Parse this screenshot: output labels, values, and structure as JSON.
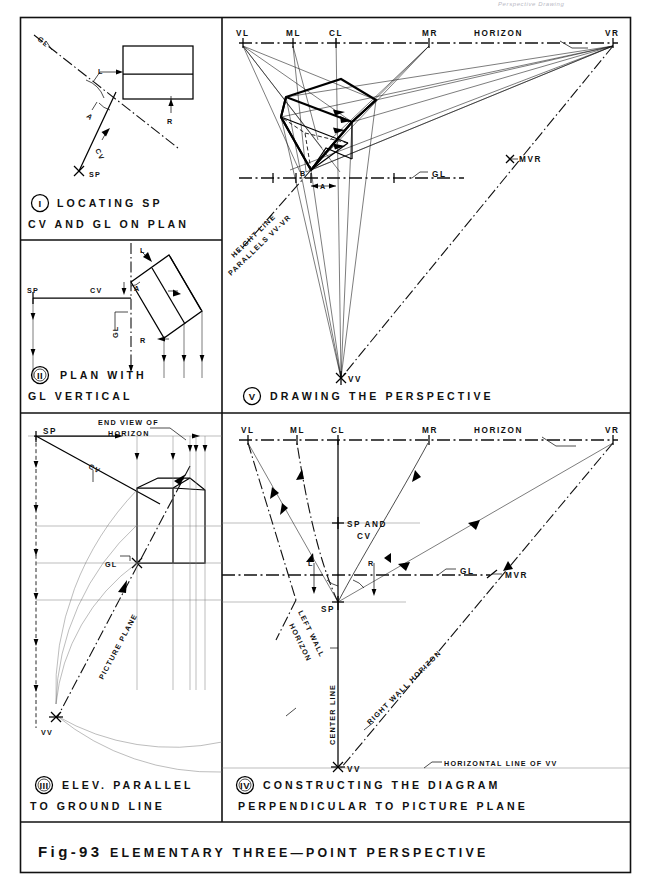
{
  "figure": {
    "header_note": "Perspective Drawing",
    "title_prefix": "Fig-93",
    "title_main": "ELEMENTARY THREE—POINT PERSPECTIVE"
  },
  "panels": [
    {
      "id": "I",
      "numeral": "I",
      "caption_line1": "LOCATING  SP",
      "caption_line2": "CV AND GL ON PLAN",
      "labels": [
        "GL",
        "L",
        "A",
        "R",
        "CV",
        "SP"
      ]
    },
    {
      "id": "II",
      "numeral": "II",
      "caption_line1": "PLAN    WITH",
      "caption_line2": "GL   VERTICAL",
      "labels": [
        "SP",
        "CV",
        "A",
        "L",
        "GL",
        "R"
      ]
    },
    {
      "id": "III",
      "numeral": "III",
      "caption_line1": "ELEV. PARALLEL",
      "caption_line2": "TO GROUND LINE",
      "labels": [
        "SP",
        "END VIEW OF",
        "HORIZON",
        "CV",
        "GL",
        "PICTURE PLANE",
        "VV"
      ]
    },
    {
      "id": "IV",
      "numeral": "IV",
      "caption_line1": "CONSTRUCTING  THE  DIAGRAM",
      "caption_line2": "PERPENDICULAR  TO  PICTURE PLANE",
      "labels": [
        "VL",
        "ML",
        "CL",
        "MR",
        "HORIZON",
        "VR",
        "SP AND",
        "CV",
        "GL",
        "MVR",
        "L",
        "R",
        "SP",
        "LEFT WALL",
        "HORIZON",
        "CENTER LINE",
        "RIGHT WALL HORIZON",
        "VV",
        "HORIZONTAL LINE OF VV"
      ]
    },
    {
      "id": "V",
      "numeral": "V",
      "caption_line1": "DRAWING  THE  PERSPECTIVE",
      "caption_line2": "",
      "labels": [
        "VL",
        "ML",
        "CL",
        "MR",
        "HORIZON",
        "VR",
        "MVR",
        "B",
        "A",
        "GL",
        "HEIGHT LINE",
        "PARALLELS VV-VR",
        "VV"
      ]
    }
  ],
  "text": {
    "VL": "VL",
    "ML": "ML",
    "CL": "CL",
    "MR": "MR",
    "VR": "VR",
    "HORIZON": "HORIZON",
    "MVR": "MVR",
    "GL": "GL",
    "SP": "SP",
    "CV": "CV",
    "VV": "VV",
    "A": "A",
    "B": "B",
    "L": "L",
    "R": "R",
    "SP_AND": "SP AND",
    "height_line": "HEIGHT LINE",
    "parallels": "PARALLELS VV-VR",
    "end_view_of": "END VIEW OF",
    "picture_plane": "PICTURE PLANE",
    "left_wall": "LEFT WALL",
    "center_line": "CENTER LINE",
    "right_wall_horizon": "RIGHT WALL HORIZON",
    "horizontal_line_of_vv": "HORIZONTAL LINE OF VV"
  },
  "colors": {
    "ink": "#111111",
    "paper": "#ffffff",
    "light_line": "#7b7b7b",
    "header_note": "#b9b9c4"
  }
}
